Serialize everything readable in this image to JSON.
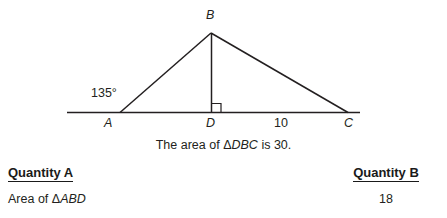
{
  "figure": {
    "vertex_labels": {
      "apex": "B",
      "left": "A",
      "foot": "D",
      "right": "C"
    },
    "angle_label": "135°",
    "segment_label": "10",
    "right_angle_marker": "right-angle-square",
    "line_color": "#231f20"
  },
  "caption": {
    "prefix": "The area of ",
    "triangle_symbol": "Δ",
    "triangle_name": "DBC",
    "suffix": " is 30."
  },
  "comparison": {
    "quantity_a": {
      "heading": "Quantity A",
      "value_prefix": "Area of ",
      "value_triangle_symbol": "Δ",
      "value_triangle_name": "ABD"
    },
    "quantity_b": {
      "heading": "Quantity B",
      "value": "18"
    }
  }
}
